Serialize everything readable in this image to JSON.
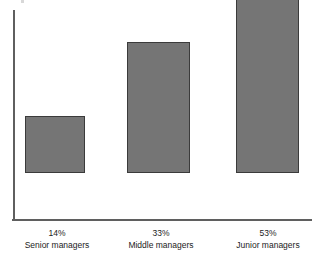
{
  "chart_data": {
    "type": "bar",
    "title": "",
    "subtitle": "",
    "xlabel": "",
    "ylabel": "",
    "categories": [
      "Senior managers",
      "Middle managers",
      "Junior managers"
    ],
    "values": [
      14,
      33,
      53
    ],
    "value_labels": [
      "14%",
      "33%",
      "53%"
    ],
    "units": "percent",
    "ylim": [
      0,
      53
    ],
    "grid": false,
    "legend": null,
    "legend_position": "none",
    "axis_ticks": [],
    "annotations": [],
    "colors": {
      "bar_fill": "#757575",
      "bar_border": "#3b3b3b",
      "axis_line": "#5f5f5f",
      "text": "#1c1c1c",
      "background": "#ffffff"
    },
    "bars": [
      {
        "category": "Senior managers",
        "value": 14,
        "value_label": "14%",
        "name_label": "Senior managers",
        "x": 25,
        "width": 60,
        "height_px": 57,
        "label_x": 9,
        "label_width": 96
      },
      {
        "category": "Middle managers",
        "value": 33,
        "value_label": "33%",
        "name_label": "Middle managers",
        "x": 127,
        "width": 63,
        "height_px": 131,
        "label_x": 113,
        "label_width": 96
      },
      {
        "category": "Junior managers",
        "value": 53,
        "value_label": "53%",
        "name_label": "Junior managers",
        "x": 236,
        "width": 63,
        "height_px": 206,
        "label_x": 220,
        "label_width": 96
      }
    ]
  }
}
